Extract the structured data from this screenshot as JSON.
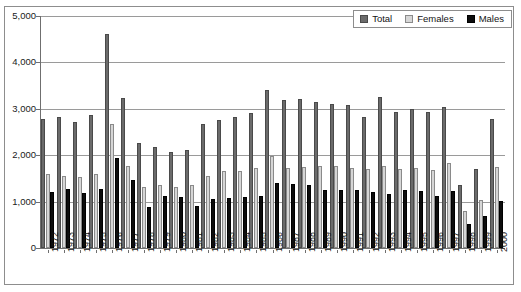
{
  "chart_data": {
    "type": "bar",
    "title": "",
    "xlabel": "",
    "ylabel": "",
    "ylim": [
      0,
      5000
    ],
    "yticks": [
      0,
      1000,
      2000,
      3000,
      4000,
      5000
    ],
    "ytick_labels": [
      "0",
      "1,000",
      "2,000",
      "3,000",
      "4,000",
      "5,000"
    ],
    "grid": true,
    "legend_position": "top-right",
    "categories": [
      "1972",
      "1973",
      "1974",
      "1975",
      "1976",
      "1977",
      "1978",
      "1979",
      "1980",
      "1981",
      "1982",
      "1983",
      "1984",
      "1985",
      "1986",
      "1987",
      "1988",
      "1989",
      "1990",
      "1991",
      "1992",
      "1993",
      "1994",
      "1995",
      "1996",
      "1997",
      "1998",
      "1999",
      "2000"
    ],
    "series": [
      {
        "name": "Total",
        "color": "#6b6b6b",
        "values": [
          2790,
          2830,
          2720,
          2870,
          4620,
          3240,
          2260,
          2180,
          2070,
          2120,
          2680,
          2760,
          2820,
          2900,
          3400,
          3190,
          3220,
          3150,
          3110,
          3080,
          2830,
          3250,
          2940,
          3000,
          2930,
          3040,
          1350,
          1700,
          2790
        ]
      },
      {
        "name": "Females",
        "color": "#d6d6d6",
        "values": [
          1590,
          1560,
          1530,
          1600,
          2680,
          1770,
          1310,
          1360,
          1320,
          1350,
          1560,
          1670,
          1670,
          1720,
          1980,
          1730,
          1740,
          1760,
          1760,
          1730,
          1700,
          1760,
          1700,
          1720,
          1680,
          1830,
          790,
          1040,
          1750
        ]
      },
      {
        "name": "Males",
        "color": "#0d0d0d",
        "values": [
          1200,
          1270,
          1190,
          1280,
          1940,
          1470,
          890,
          1130,
          1090,
          900,
          1060,
          1080,
          1090,
          1120,
          1410,
          1370,
          1360,
          1260,
          1240,
          1250,
          1210,
          1170,
          1250,
          1230,
          1130,
          1220,
          510,
          690,
          1010
        ]
      }
    ]
  },
  "legend": {
    "items": [
      {
        "label": "Total",
        "key": "total"
      },
      {
        "label": "Females",
        "key": "female"
      },
      {
        "label": "Males",
        "key": "male"
      }
    ]
  }
}
